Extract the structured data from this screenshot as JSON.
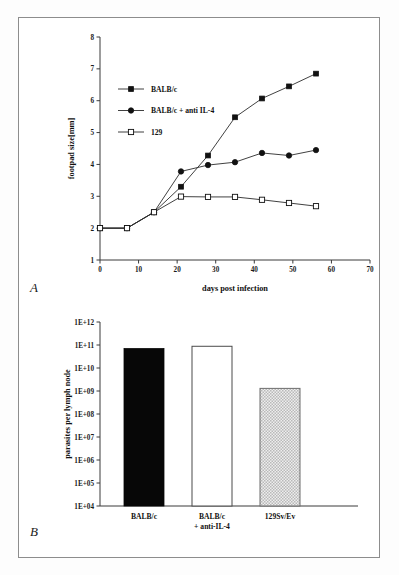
{
  "figure": {
    "panel_a_label": "A",
    "panel_b_label": "B"
  },
  "chart_data": [
    {
      "panel": "A",
      "type": "line",
      "title": "",
      "xlabel": "days post infection",
      "ylabel": "footpad size[mm]",
      "xlim": [
        0,
        70
      ],
      "ylim": [
        1,
        8
      ],
      "xticks": [
        "0",
        "10",
        "20",
        "30",
        "40",
        "50",
        "60",
        "70"
      ],
      "yticks": [
        "1",
        "2",
        "3",
        "4",
        "5",
        "6",
        "7",
        "8"
      ],
      "grid": false,
      "legend_position": "upper-left-inside",
      "x": [
        0,
        7,
        14,
        21,
        28,
        35,
        42,
        49,
        56
      ],
      "series": [
        {
          "name": "BALB/c",
          "marker": "filled-square",
          "values": [
            2.0,
            2.0,
            2.5,
            3.3,
            4.28,
            5.48,
            6.07,
            6.45,
            6.85
          ]
        },
        {
          "name": "BALB/c + anti IL-4",
          "marker": "filled-circle",
          "values": [
            2.0,
            2.0,
            2.5,
            3.78,
            3.98,
            4.07,
            4.36,
            4.28,
            4.45
          ]
        },
        {
          "name": "129",
          "marker": "open-square",
          "values": [
            2.0,
            2.0,
            2.5,
            2.99,
            2.98,
            2.98,
            2.89,
            2.79,
            2.69
          ]
        }
      ]
    },
    {
      "panel": "B",
      "type": "bar",
      "title": "",
      "xlabel": "",
      "ylabel": "parasites per lymph node",
      "yscale": "log",
      "ylim": [
        10000,
        1000000000000
      ],
      "yticks": [
        "1E+04",
        "1E+05",
        "1E+06",
        "1E+07",
        "1E+08",
        "1E+09",
        "1E+10",
        "1E+11",
        "1E+12"
      ],
      "grid": false,
      "categories": [
        "BALB/c",
        "BALB/c\n+ anti-IL-4",
        "129Sv/Ev"
      ],
      "category_lines": [
        [
          "BALB/c"
        ],
        [
          "BALB/c",
          "+ anti-IL-4"
        ],
        [
          "129Sv/Ev"
        ]
      ],
      "values": [
        70000000000,
        88000000000,
        1300000000
      ],
      "bar_styles": [
        "solid-black",
        "open-white",
        "checkered-gray"
      ]
    }
  ],
  "colors": {
    "ink": "#111111",
    "axis": "#3a3a3a",
    "frame": "#8d8d8d",
    "bar_solid": "#070707",
    "bar_open_fill": "#ffffff",
    "bar_hatch_fill": "#d9d9d9"
  }
}
